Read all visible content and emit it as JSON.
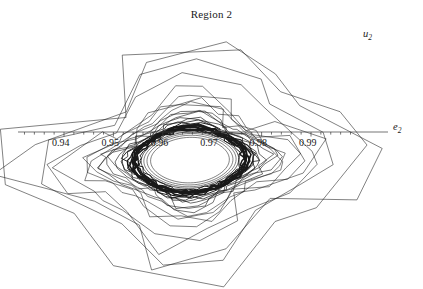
{
  "title": "Region 2",
  "axes": {
    "x_label_text": "e",
    "x_label_sub": "2",
    "y_label_text": "u",
    "y_label_sub": "2"
  },
  "chart_data": {
    "type": "line",
    "title": "Region 2",
    "xlabel": "e_2",
    "ylabel": "u_2",
    "grid": false,
    "legend": null,
    "xlim": [
      0.9325,
      0.9985
    ],
    "ylim": [
      0.8825,
      0.9125
    ],
    "x_ticks": [
      0.94,
      0.95,
      0.96,
      0.97,
      0.98,
      0.99
    ],
    "x_tick_labels": [
      "0.94",
      "0.95",
      "0.96",
      "0.97",
      "0.98",
      "0.99"
    ],
    "y_ticks": [
      0.885,
      0.89,
      0.895,
      0.905,
      0.91
    ],
    "y_tick_labels": [
      "0.885",
      "0.89",
      "0.895",
      "0.905",
      "0.91"
    ],
    "y_minor_step": 0.001,
    "x_minor_step": 0.002,
    "axis_origin": [
      0.9,
      0.9
    ],
    "center": [
      0.9655,
      0.8962
    ],
    "series": [
      {
        "name": "orbit-1",
        "rx": 0.033,
        "ry": 0.0144,
        "npts": 13,
        "rot": -0.05,
        "width": 0.55,
        "sq": 0.78,
        "skew": 0.16,
        "jag": 0.012
      },
      {
        "name": "orbit-2",
        "rx": 0.0306,
        "ry": 0.0132,
        "npts": 14,
        "rot": 0.1,
        "width": 0.55,
        "sq": 0.76,
        "skew": 0.15,
        "jag": 0.01
      },
      {
        "name": "orbit-3",
        "rx": 0.0268,
        "ry": 0.0113,
        "npts": 15,
        "rot": 0.3,
        "width": 0.55,
        "sq": 0.74,
        "skew": 0.14,
        "jag": 0.009
      },
      {
        "name": "orbit-4",
        "rx": 0.0238,
        "ry": 0.0098,
        "npts": 17,
        "rot": -0.2,
        "width": 0.55,
        "sq": 0.7,
        "skew": 0.13,
        "jag": 0.008
      },
      {
        "name": "orbit-5",
        "rx": 0.0214,
        "ry": 0.0086,
        "npts": 19,
        "rot": 0.45,
        "width": 0.55,
        "sq": 0.66,
        "skew": 0.12,
        "jag": 0.007
      },
      {
        "name": "orbit-6",
        "rx": 0.0196,
        "ry": 0.00775,
        "npts": 21,
        "rot": 0.0,
        "width": 0.55,
        "sq": 0.62,
        "skew": 0.11,
        "jag": 0.006
      },
      {
        "name": "orbit-7",
        "rx": 0.0182,
        "ry": 0.00715,
        "npts": 23,
        "rot": 0.55,
        "width": 0.55,
        "sq": 0.58,
        "skew": 0.11,
        "jag": 0.005
      },
      {
        "name": "orbit-8",
        "rx": 0.0171,
        "ry": 0.00668,
        "npts": 25,
        "rot": 0.25,
        "width": 0.55,
        "sq": 0.54,
        "skew": 0.1,
        "jag": 0.004
      },
      {
        "name": "orbit-9",
        "rx": 0.0162,
        "ry": 0.0063,
        "npts": 27,
        "rot": 0.8,
        "width": 0.55,
        "sq": 0.5,
        "skew": 0.1,
        "jag": 0.004
      },
      {
        "name": "orbit-10",
        "rx": 0.0154,
        "ry": 0.00598,
        "npts": 29,
        "rot": 0.4,
        "width": 0.6,
        "sq": 0.46,
        "skew": 0.1,
        "jag": 0.003
      },
      {
        "name": "orbit-11",
        "rx": 0.0147,
        "ry": 0.0057,
        "npts": 31,
        "rot": 1.0,
        "width": 0.6,
        "sq": 0.42,
        "skew": 0.09,
        "jag": 0.003
      },
      {
        "name": "orbit-12",
        "rx": 0.0141,
        "ry": 0.00546,
        "npts": 33,
        "rot": 0.6,
        "width": 0.6,
        "sq": 0.38,
        "skew": 0.09,
        "jag": 0.003
      },
      {
        "name": "orbit-13",
        "rx": 0.0136,
        "ry": 0.00525,
        "npts": 36,
        "rot": 1.2,
        "width": 0.65,
        "sq": 0.34,
        "skew": 0.09,
        "jag": 0.002
      },
      {
        "name": "orbit-14",
        "rx": 0.0131,
        "ry": 0.00506,
        "npts": 39,
        "rot": 0.15,
        "width": 0.7,
        "sq": 0.3,
        "skew": 0.08,
        "jag": 0.002
      },
      {
        "name": "orbit-15",
        "rx": 0.0127,
        "ry": 0.00489,
        "npts": 42,
        "rot": 0.9,
        "width": 0.8,
        "sq": 0.26,
        "skew": 0.08,
        "jag": 0.002
      },
      {
        "name": "orbit-16",
        "rx": 0.0123,
        "ry": 0.00474,
        "npts": 45,
        "rot": 1.4,
        "width": 0.95,
        "sq": 0.22,
        "skew": 0.08,
        "jag": 0.002
      },
      {
        "name": "orbit-17",
        "rx": 0.012,
        "ry": 0.00461,
        "npts": 48,
        "rot": 0.5,
        "width": 1.2,
        "sq": 0.18,
        "skew": 0.08,
        "jag": 0.001
      },
      {
        "name": "orbit-18",
        "rx": 0.0117,
        "ry": 0.00449,
        "npts": 52,
        "rot": 1.1,
        "width": 1.6,
        "sq": 0.15,
        "skew": 0.07,
        "jag": 0.001
      },
      {
        "name": "orbit-19",
        "rx": 0.0114,
        "ry": 0.00438,
        "npts": 56,
        "rot": 0.7,
        "width": 2.1,
        "sq": 0.12,
        "skew": 0.07,
        "jag": 0.001
      },
      {
        "name": "orbit-20",
        "rx": 0.0111,
        "ry": 0.00427,
        "npts": 60,
        "rot": 1.6,
        "width": 2.4,
        "sq": 0.1,
        "skew": 0.07,
        "jag": 0.001
      },
      {
        "name": "orbit-21",
        "rx": 0.0108,
        "ry": 0.00416,
        "npts": 64,
        "rot": 0.3,
        "width": 2.1,
        "sq": 0.09,
        "skew": 0.07,
        "jag": 0.001
      },
      {
        "name": "orbit-22",
        "rx": 0.0105,
        "ry": 0.00404,
        "npts": 68,
        "rot": 1.3,
        "width": 1.5,
        "sq": 0.08,
        "skew": 0.06,
        "jag": 0.001
      },
      {
        "name": "orbit-23",
        "rx": 0.0101,
        "ry": 0.0039,
        "npts": 72,
        "rot": 0.85,
        "width": 1.0,
        "sq": 0.07,
        "skew": 0.06,
        "jag": 0.001
      },
      {
        "name": "orbit-24",
        "rx": 0.0097,
        "ry": 0.00374,
        "npts": 76,
        "rot": 1.8,
        "width": 0.7,
        "sq": 0.06,
        "skew": 0.06,
        "jag": 0.0
      },
      {
        "name": "orbit-25",
        "rx": 0.0092,
        "ry": 0.00355,
        "npts": 80,
        "rot": 0.55,
        "width": 0.55,
        "sq": 0.05,
        "skew": 0.06,
        "jag": 0.0
      },
      {
        "name": "orbit-26",
        "rx": 0.0086,
        "ry": 0.00332,
        "npts": 84,
        "rot": 1.45,
        "width": 0.55,
        "sq": 0.04,
        "skew": 0.05,
        "jag": 0.0
      },
      {
        "name": "orbit-27",
        "rx": 0.0079,
        "ry": 0.00305,
        "npts": 88,
        "rot": 0.95,
        "width": 0.55,
        "sq": 0.03,
        "skew": 0.05,
        "jag": 0.0
      }
    ]
  }
}
